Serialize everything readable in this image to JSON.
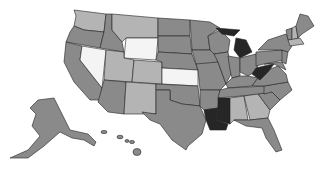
{
  "map": {
    "title": "",
    "type": "choropleth",
    "region": "United States",
    "palette": {
      "white": "#f4f4f4",
      "light": "#b4b4b4",
      "medium": "#8a8a8a",
      "dark": "#262626"
    },
    "states": [
      {
        "id": "WA",
        "level": "light"
      },
      {
        "id": "OR",
        "level": "medium"
      },
      {
        "id": "CA",
        "level": "medium"
      },
      {
        "id": "ID",
        "level": "medium"
      },
      {
        "id": "NV",
        "level": "white"
      },
      {
        "id": "MT",
        "level": "light"
      },
      {
        "id": "WY",
        "level": "white"
      },
      {
        "id": "UT",
        "level": "light"
      },
      {
        "id": "CO",
        "level": "light"
      },
      {
        "id": "AZ",
        "level": "medium"
      },
      {
        "id": "NM",
        "level": "light"
      },
      {
        "id": "ND",
        "level": "medium"
      },
      {
        "id": "SD",
        "level": "medium"
      },
      {
        "id": "NE",
        "level": "medium"
      },
      {
        "id": "KS",
        "level": "white"
      },
      {
        "id": "OK",
        "level": "medium"
      },
      {
        "id": "TX",
        "level": "medium"
      },
      {
        "id": "MN",
        "level": "medium"
      },
      {
        "id": "IA",
        "level": "medium"
      },
      {
        "id": "MO",
        "level": "medium"
      },
      {
        "id": "AR",
        "level": "medium"
      },
      {
        "id": "LA",
        "level": "dark"
      },
      {
        "id": "WI",
        "level": "medium"
      },
      {
        "id": "IL",
        "level": "medium"
      },
      {
        "id": "MI",
        "level": "dark"
      },
      {
        "id": "IN",
        "level": "medium"
      },
      {
        "id": "OH",
        "level": "medium"
      },
      {
        "id": "KY",
        "level": "medium"
      },
      {
        "id": "TN",
        "level": "medium"
      },
      {
        "id": "MS",
        "level": "dark"
      },
      {
        "id": "AL",
        "level": "light"
      },
      {
        "id": "GA",
        "level": "light"
      },
      {
        "id": "FL",
        "level": "medium"
      },
      {
        "id": "SC",
        "level": "medium"
      },
      {
        "id": "NC",
        "level": "medium"
      },
      {
        "id": "VA",
        "level": "medium"
      },
      {
        "id": "WV",
        "level": "dark"
      },
      {
        "id": "PA",
        "level": "medium"
      },
      {
        "id": "NY",
        "level": "medium"
      },
      {
        "id": "ME",
        "level": "medium"
      },
      {
        "id": "NH",
        "level": "light"
      },
      {
        "id": "VT",
        "level": "medium"
      },
      {
        "id": "MA",
        "level": "light"
      },
      {
        "id": "NJ",
        "level": "medium"
      },
      {
        "id": "MD",
        "level": "medium"
      },
      {
        "id": "AK",
        "level": "medium"
      },
      {
        "id": "HI",
        "level": "medium"
      }
    ]
  }
}
